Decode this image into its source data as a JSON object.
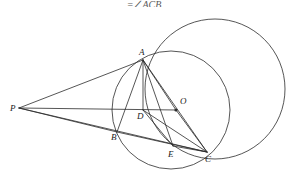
{
  "header": {
    "partial_text": "=∠ACB"
  },
  "figure": {
    "type": "geometry-diagram",
    "stroke_color": "#2b2b2b",
    "label_color": "#1a1a1a",
    "background": "#ffffff",
    "width": 288,
    "height": 173,
    "points": [
      {
        "id": "P",
        "label": "P",
        "x": 19,
        "y": 108,
        "label_x": 10,
        "label_y": 111,
        "dot": false
      },
      {
        "id": "A",
        "label": "A",
        "x": 143,
        "y": 60,
        "label_x": 139,
        "label_y": 55,
        "dot": false
      },
      {
        "id": "B",
        "label": "B",
        "x": 117,
        "y": 132,
        "label_x": 111,
        "label_y": 140,
        "dot": false
      },
      {
        "id": "C",
        "label": "C",
        "x": 207,
        "y": 152,
        "label_x": 205,
        "label_y": 162,
        "dot": false
      },
      {
        "id": "D",
        "label": "D",
        "x": 143,
        "y": 110,
        "label_x": 137,
        "label_y": 119,
        "dot": false
      },
      {
        "id": "E",
        "label": "E",
        "x": 173,
        "y": 146,
        "label_x": 168,
        "label_y": 157,
        "dot": false
      },
      {
        "id": "O",
        "label": "O",
        "x": 176,
        "y": 110,
        "label_x": 180,
        "label_y": 104,
        "dot": true
      }
    ],
    "circles": [
      {
        "id": "circle-outer",
        "cx": 215,
        "cy": 89,
        "r": 70
      },
      {
        "id": "circle-O",
        "cx": 171,
        "cy": 110,
        "r": 59
      }
    ],
    "segments": [
      {
        "id": "PA",
        "from": "P",
        "to": "A"
      },
      {
        "id": "PB",
        "from": "P",
        "to": "B"
      },
      {
        "id": "PC",
        "from": "P",
        "to": "C"
      },
      {
        "id": "PO",
        "from": "P",
        "to": "O"
      },
      {
        "id": "AB",
        "from": "A",
        "to": "B"
      },
      {
        "id": "AC",
        "from": "A",
        "to": "C"
      },
      {
        "id": "AD",
        "from": "A",
        "to": "D"
      },
      {
        "id": "AE",
        "from": "A",
        "to": "E"
      },
      {
        "id": "AO",
        "from": "A",
        "to": "O"
      },
      {
        "id": "BC",
        "from": "B",
        "to": "C"
      },
      {
        "id": "DC",
        "from": "D",
        "to": "C"
      },
      {
        "id": "DE",
        "from": "D",
        "to": "E"
      },
      {
        "id": "EC",
        "from": "E",
        "to": "C"
      },
      {
        "id": "OC",
        "from": "O",
        "to": "C"
      }
    ]
  }
}
